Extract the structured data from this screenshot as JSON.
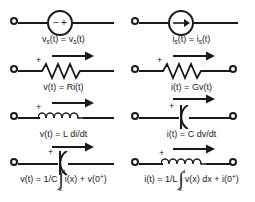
{
  "figure": {
    "ink_color": "#1a1a1a",
    "background": "#ffffff"
  },
  "columns": [
    {
      "name": "voltage-column",
      "rows": [
        {
          "element": "independent-voltage-source",
          "symbol": "source-circle",
          "polarity_left": "−",
          "polarity_right": "+",
          "has_arrow": false,
          "plus_label": "",
          "equation_text": "v",
          "equation": {
            "lhs_var": "v",
            "lhs_sub": "s",
            "lhs_rest": "(t) = ",
            "rhs_var": "v",
            "rhs_sub": "s",
            "rhs_rest": "(t)"
          }
        },
        {
          "element": "resistor",
          "symbol": "zigzag",
          "has_arrow": true,
          "plus_label": "+",
          "equation": {
            "lhs_var": "v",
            "lhs_sub": "",
            "lhs_rest": "(t) = ",
            "rhs_var": "R",
            "rhs_sub": "",
            "rhs_rest": "i(t)"
          }
        },
        {
          "element": "inductor",
          "symbol": "coil",
          "has_arrow": true,
          "plus_label": "+",
          "equation": {
            "lhs_var": "v",
            "lhs_sub": "",
            "lhs_rest": "(t) = ",
            "rhs_var": "L",
            "rhs_sub": "",
            "rhs_rest": " di/dt"
          }
        },
        {
          "element": "capacitor",
          "symbol": "capacitor-plates",
          "has_arrow": true,
          "plus_label": "+",
          "integral_equation": {
            "prefix": "v(t) = 1/C",
            "upper_limit": "t",
            "lower_limit": "0",
            "integrand": "i(x)",
            "suffix": " + v(0",
            "sup": "+",
            "tail": ")"
          }
        }
      ]
    },
    {
      "name": "current-column",
      "rows": [
        {
          "element": "independent-current-source",
          "symbol": "source-circle-arrow",
          "has_arrow": false,
          "plus_label": "",
          "equation": {
            "lhs_var": "i",
            "lhs_sub": "s",
            "lhs_rest": "(t) = ",
            "rhs_var": "i",
            "rhs_sub": "s",
            "rhs_rest": "(t)"
          }
        },
        {
          "element": "conductor",
          "symbol": "zigzag",
          "has_arrow": true,
          "plus_label": "+",
          "equation": {
            "lhs_var": "i",
            "lhs_sub": "",
            "lhs_rest": "(t) = ",
            "rhs_var": "G",
            "rhs_sub": "",
            "rhs_rest": "v(t)"
          }
        },
        {
          "element": "capacitor",
          "symbol": "capacitor-plates",
          "has_arrow": true,
          "plus_label": "+",
          "equation": {
            "lhs_var": "i",
            "lhs_sub": "",
            "lhs_rest": "(t) = ",
            "rhs_var": "C",
            "rhs_sub": "",
            "rhs_rest": " dv/dt"
          }
        },
        {
          "element": "inductor",
          "symbol": "coil",
          "has_arrow": true,
          "plus_label": "+",
          "integral_equation": {
            "prefix": "i(t) = 1/L",
            "upper_limit": "t",
            "lower_limit": "0",
            "integrand": "v(x) dx",
            "suffix": " + i(0",
            "sup": "+",
            "tail": ")"
          }
        }
      ]
    }
  ]
}
